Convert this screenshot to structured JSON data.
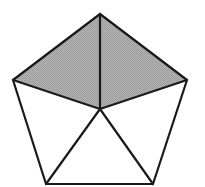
{
  "diagram": {
    "type": "geometry",
    "shape": "regular-pentagon",
    "colors": {
      "background": "#ffffff",
      "stroke": "#1a1a1a",
      "shaded_fill": "#a9a9a9",
      "unshaded_fill": "#ffffff"
    },
    "stroke_width": 2.2,
    "center": {
      "x": 100,
      "y": 109
    },
    "vertices": [
      {
        "name": "top",
        "x": 100,
        "y": 14
      },
      {
        "name": "right",
        "x": 187,
        "y": 80
      },
      {
        "name": "bottom-right",
        "x": 153,
        "y": 184
      },
      {
        "name": "bottom-left",
        "x": 46,
        "y": 184
      },
      {
        "name": "left",
        "x": 13,
        "y": 80
      }
    ],
    "triangles": [
      {
        "name": "top-right",
        "from": [
          "top",
          "right"
        ],
        "shaded": true
      },
      {
        "name": "right-lower",
        "from": [
          "right",
          "bottom-right"
        ],
        "shaded": false
      },
      {
        "name": "bottom",
        "from": [
          "bottom-right",
          "bottom-left"
        ],
        "shaded": false
      },
      {
        "name": "left-lower",
        "from": [
          "bottom-left",
          "left"
        ],
        "shaded": false
      },
      {
        "name": "top-left",
        "from": [
          "left",
          "top"
        ],
        "shaded": true
      }
    ],
    "shaded_count": 2,
    "total_count": 5
  }
}
